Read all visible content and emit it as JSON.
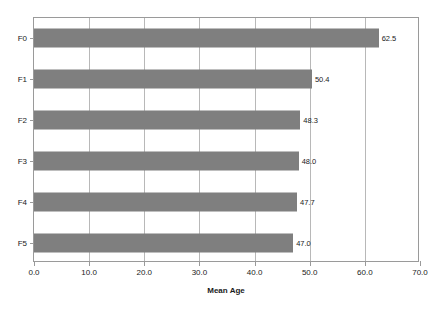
{
  "chart_data": {
    "type": "bar",
    "orientation": "horizontal",
    "title": "",
    "xlabel": "Mean Age",
    "ylabel": "",
    "categories": [
      "F0",
      "F1",
      "F2",
      "F3",
      "F4",
      "F5"
    ],
    "values": [
      62.5,
      50.4,
      48.3,
      48.0,
      47.7,
      47.0
    ],
    "value_labels": [
      "62.5",
      "50.4",
      "48.3",
      "48.0",
      "47.7",
      "47.0"
    ],
    "xlim": [
      0.0,
      70.0
    ],
    "xticks": [
      0.0,
      10.0,
      20.0,
      30.0,
      40.0,
      50.0,
      60.0,
      70.0
    ],
    "xtick_labels": [
      "0.0",
      "10.0",
      "20.0",
      "30.0",
      "40.0",
      "50.0",
      "60.0",
      "70.0"
    ],
    "grid": "vertical",
    "legend": null,
    "bar_color": "#7f7f7f",
    "frame_color": "#9a9a9a",
    "gridline_color": "#b8b8b8",
    "background_color": "#ffffff"
  }
}
